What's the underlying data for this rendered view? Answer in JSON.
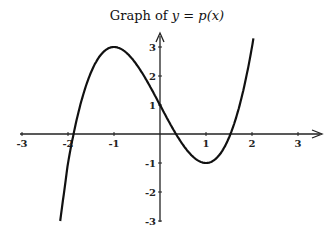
{
  "chart_data": {
    "type": "line",
    "title_prefix": "Graph of ",
    "title_expr": "y = p(x)",
    "xlabel": "",
    "ylabel": "",
    "xlim": [
      -3,
      3
    ],
    "ylim": [
      -3,
      3
    ],
    "x_ticks": [
      "-3",
      "-2",
      "-1",
      "1",
      "2",
      "3"
    ],
    "y_ticks": [
      "3",
      "2",
      "1",
      "-1",
      "-2",
      "-3"
    ],
    "grid": false,
    "legend": null,
    "series": [
      {
        "name": "p(x)",
        "function": "x^3 - 3x + 1",
        "x": [
          -2.17,
          -2.0,
          -1.5,
          -1.0,
          -0.5,
          0.0,
          0.5,
          1.0,
          1.5,
          2.0,
          2.03
        ],
        "y": [
          -3.0,
          -1.0,
          2.125,
          3.0,
          2.375,
          1.0,
          -0.375,
          -1.0,
          -0.125,
          3.0,
          3.3
        ]
      }
    ],
    "key_points": {
      "local_max": [
        -1,
        3
      ],
      "local_min": [
        1,
        -1
      ],
      "y_intercept": [
        0,
        1
      ]
    }
  }
}
